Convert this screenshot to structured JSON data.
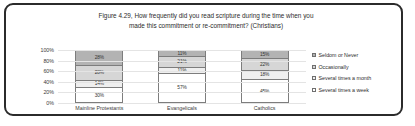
{
  "chart_data": {
    "type": "bar",
    "title": "Figure 4.29, How frequently did you read scripture during the time when you made this commitment or re-commitment? (Christians)",
    "title_line1": "Figure 4.29, How frequently did you read scripture during the time when you",
    "title_line2": "made this commitment or re-commitment? (Christians)",
    "stacked": true,
    "orientation": "vertical",
    "xlabel": "",
    "ylabel": "",
    "ylim": [
      0,
      100
    ],
    "grid": true,
    "legend_position": "right",
    "categories": [
      "Mainline Protestants",
      "Evangelicals",
      "Catholics"
    ],
    "ticks": [
      "100%",
      "80%",
      "60%",
      "40%",
      "20%",
      "0%"
    ],
    "tick_values": [
      100,
      80,
      60,
      40,
      20,
      0
    ],
    "series": [
      {
        "name": "Several times a week",
        "color": "#ffffff",
        "values": [
          30,
          57,
          45
        ],
        "labels": [
          "30%",
          "57%",
          "45%"
        ]
      },
      {
        "name": "Several times a month",
        "color": "#efefef",
        "values": [
          14,
          11,
          18
        ],
        "labels": [
          "14%",
          "11%",
          "18%"
        ]
      },
      {
        "name": "Occasionally",
        "color": "#d6d6d6",
        "values": [
          28,
          21,
          22
        ],
        "labels": [
          "28%",
          "21%",
          "22%"
        ]
      },
      {
        "name": "Seldom or Never",
        "color": "#b3b3b3",
        "values": [
          28,
          11,
          15
        ],
        "labels": [
          "28%",
          "11%",
          "15%"
        ]
      }
    ],
    "legend_entries": [
      "Seldom or Never",
      "Occasionally",
      "Several times a month",
      "Several times a week"
    ]
  },
  "colors": {
    "frame": "#2b2b2b",
    "background": "#ffffff",
    "gridline": "#e4e4e4",
    "bar_border": "#7d7d7d",
    "text": "#2d2d2d"
  }
}
